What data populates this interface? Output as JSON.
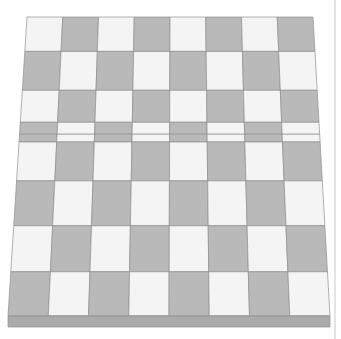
{
  "scene": {
    "title": "Checkerboard in perspective",
    "description": "An 8 by 8 checkerboard rendered in three-quarter perspective with a visible board edge at the bottom",
    "canvas": {
      "width": 341,
      "height": 339,
      "background": "#ffffff"
    }
  },
  "board": {
    "rows": 8,
    "columns": 8,
    "light_color": "#f4f4f4",
    "dark_color": "#b9b9b9",
    "grid_line_color": "#8f8f8f",
    "edge_band_color": "#ababab",
    "edge_band_top_color": "#9d9d9d",
    "top_left_color": "light",
    "geometry": {
      "top_left_x": 27,
      "top_right_x": 313,
      "bottom_left_x": 8,
      "bottom_right_x": 330,
      "top_y": 17,
      "bottom_y": 316,
      "edge_band_height": 11,
      "row_fractions": [
        0,
        0.115,
        0.245,
        0.352,
        0.392,
        0.418,
        0.548,
        0.698,
        0.852,
        1.0
      ],
      "note": "row_fractions has an extra sliver pair near the middle reproducing the source rendering"
    },
    "pattern": [
      [
        "light",
        "dark",
        "light",
        "dark",
        "light",
        "dark",
        "light",
        "dark"
      ],
      [
        "dark",
        "light",
        "dark",
        "light",
        "dark",
        "light",
        "dark",
        "light"
      ],
      [
        "light",
        "dark",
        "light",
        "dark",
        "light",
        "dark",
        "light",
        "dark"
      ],
      [
        "dark",
        "light",
        "dark",
        "light",
        "dark",
        "light",
        "dark",
        "light"
      ],
      [
        "dark",
        "light",
        "dark",
        "light",
        "dark",
        "light",
        "dark",
        "light"
      ],
      [
        "light",
        "dark",
        "light",
        "dark",
        "light",
        "dark",
        "light",
        "dark"
      ],
      [
        "dark",
        "light",
        "dark",
        "light",
        "dark",
        "light",
        "dark",
        "light"
      ],
      [
        "light",
        "dark",
        "light",
        "dark",
        "light",
        "dark",
        "light",
        "dark"
      ],
      [
        "dark",
        "light",
        "dark",
        "light",
        "dark",
        "light",
        "dark",
        "light"
      ]
    ]
  },
  "overlay": {
    "right_rule_x": 335,
    "right_rule_color": "#c9c9c9"
  }
}
